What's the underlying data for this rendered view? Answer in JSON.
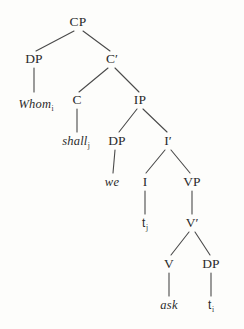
{
  "figure": {
    "name": "syntax-tree-whom-shall-we-ask",
    "sentence": "Whom shall we ask",
    "background_color": "#fdfdfb",
    "line_color": "#4a4a4a",
    "text_color": "#2b2b2b"
  },
  "nodes": [
    {
      "id": "cp",
      "label": "CP",
      "kind": "category",
      "x": 78,
      "y": 22
    },
    {
      "id": "dp1",
      "label": "DP",
      "kind": "category",
      "x": 34,
      "y": 59
    },
    {
      "id": "cbar",
      "label": "C′",
      "kind": "category",
      "x": 112,
      "y": 59
    },
    {
      "id": "whom",
      "label": "Whom",
      "sub": "i",
      "kind": "lexical",
      "x": 36,
      "y": 104
    },
    {
      "id": "c",
      "label": "C",
      "kind": "category",
      "x": 77,
      "y": 100
    },
    {
      "id": "ip",
      "label": "IP",
      "kind": "category",
      "x": 140,
      "y": 100
    },
    {
      "id": "shall",
      "label": "shall",
      "sub": "j",
      "kind": "lexical",
      "x": 76,
      "y": 141
    },
    {
      "id": "dp2",
      "label": "DP",
      "kind": "category",
      "x": 117,
      "y": 141
    },
    {
      "id": "ibar",
      "label": "I′",
      "kind": "category",
      "x": 168,
      "y": 141
    },
    {
      "id": "we",
      "label": "we",
      "kind": "lexical",
      "x": 112,
      "y": 182
    },
    {
      "id": "i",
      "label": "I",
      "kind": "category",
      "x": 145,
      "y": 182
    },
    {
      "id": "vp",
      "label": "VP",
      "kind": "category",
      "x": 192,
      "y": 182
    },
    {
      "id": "tj",
      "label": "t",
      "sub": "j",
      "kind": "trace",
      "x": 145,
      "y": 223
    },
    {
      "id": "vbar",
      "label": "V′",
      "kind": "category",
      "x": 192,
      "y": 223
    },
    {
      "id": "v",
      "label": "V",
      "kind": "category",
      "x": 169,
      "y": 264
    },
    {
      "id": "dp3",
      "label": "DP",
      "kind": "category",
      "x": 211,
      "y": 264
    },
    {
      "id": "ask",
      "label": "ask",
      "kind": "lexical",
      "x": 169,
      "y": 305
    },
    {
      "id": "ti",
      "label": "t",
      "sub": "i",
      "kind": "trace",
      "x": 211,
      "y": 305
    }
  ],
  "edges": [
    {
      "from": "cp",
      "to": "dp1",
      "x1": 74,
      "y1": 31,
      "x2": 36,
      "y2": 51
    },
    {
      "from": "cp",
      "to": "cbar",
      "x1": 83,
      "y1": 31,
      "x2": 110,
      "y2": 51
    },
    {
      "from": "dp1",
      "to": "whom",
      "x1": 34,
      "y1": 68,
      "x2": 34,
      "y2": 92
    },
    {
      "from": "cbar",
      "to": "c",
      "x1": 108,
      "y1": 68,
      "x2": 79,
      "y2": 92
    },
    {
      "from": "cbar",
      "to": "ip",
      "x1": 115,
      "y1": 68,
      "x2": 139,
      "y2": 92
    },
    {
      "from": "c",
      "to": "shall",
      "x1": 77,
      "y1": 109,
      "x2": 77,
      "y2": 132
    },
    {
      "from": "ip",
      "to": "dp2",
      "x1": 137,
      "y1": 109,
      "x2": 119,
      "y2": 132
    },
    {
      "from": "ip",
      "to": "ibar",
      "x1": 143,
      "y1": 109,
      "x2": 167,
      "y2": 132
    },
    {
      "from": "dp2",
      "to": "we",
      "x1": 115,
      "y1": 150,
      "x2": 113,
      "y2": 173
    },
    {
      "from": "ibar",
      "to": "i",
      "x1": 165,
      "y1": 150,
      "x2": 146,
      "y2": 173
    },
    {
      "from": "ibar",
      "to": "vp",
      "x1": 171,
      "y1": 150,
      "x2": 190,
      "y2": 173
    },
    {
      "from": "i",
      "to": "tj",
      "x1": 145,
      "y1": 191,
      "x2": 145,
      "y2": 214
    },
    {
      "from": "vp",
      "to": "vbar",
      "x1": 192,
      "y1": 191,
      "x2": 192,
      "y2": 214
    },
    {
      "from": "vbar",
      "to": "v",
      "x1": 189,
      "y1": 232,
      "x2": 171,
      "y2": 255
    },
    {
      "from": "vbar",
      "to": "dp3",
      "x1": 195,
      "y1": 232,
      "x2": 210,
      "y2": 255
    },
    {
      "from": "v",
      "to": "ask",
      "x1": 169,
      "y1": 273,
      "x2": 169,
      "y2": 296
    },
    {
      "from": "dp3",
      "to": "ti",
      "x1": 211,
      "y1": 273,
      "x2": 211,
      "y2": 296
    }
  ]
}
